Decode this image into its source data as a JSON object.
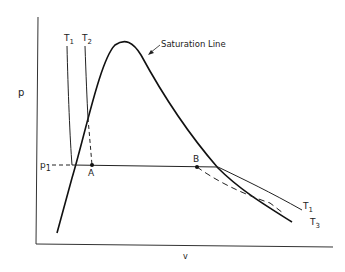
{
  "diagram": {
    "axes": {
      "y_label": "p",
      "x_label": "v"
    },
    "curves": {
      "saturation_label": "Saturation Line",
      "isotherm_T1": {
        "main": "T",
        "sub": "1"
      },
      "isotherm_T2": {
        "main": "T",
        "sub": "2"
      },
      "isotherm_T1_right": {
        "main": "T",
        "sub": "1"
      },
      "isotherm_T3": {
        "main": "T",
        "sub": "3"
      }
    },
    "pressure_level": {
      "main": "p",
      "sub": "1"
    },
    "points": {
      "A": "A",
      "B": "B"
    },
    "colors": {
      "line": "#222222",
      "background": "#ffffff"
    }
  }
}
